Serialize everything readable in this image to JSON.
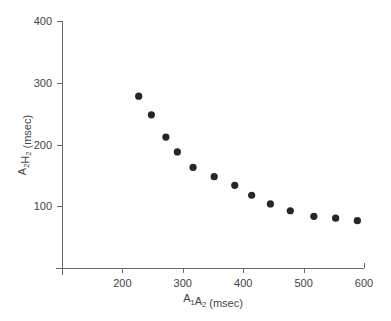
{
  "chart_data": {
    "type": "scatter",
    "title": "",
    "xlabel": "A1A2 (msec)",
    "xlabel_parts": [
      {
        "text": "A",
        "sub": false
      },
      {
        "text": "1",
        "sub": true
      },
      {
        "text": "A",
        "sub": false
      },
      {
        "text": "2",
        "sub": true
      },
      {
        "text": " (msec)",
        "sub": false
      }
    ],
    "ylabel": "A2H2 (msec)",
    "ylabel_parts": [
      {
        "text": "A",
        "sub": false
      },
      {
        "text": "2",
        "sub": true
      },
      {
        "text": "H",
        "sub": false
      },
      {
        "text": "2",
        "sub": true
      },
      {
        "text": " (msec)",
        "sub": false
      }
    ],
    "xlim": [
      100,
      600
    ],
    "ylim": [
      0,
      400
    ],
    "xticks": [
      200,
      300,
      400,
      500,
      600
    ],
    "yticks": [
      100,
      200,
      300,
      400
    ],
    "grid": false,
    "legend": null,
    "marker_color": "#262626",
    "series": [
      {
        "name": "A2H2 vs A1A2",
        "x": [
          227,
          248,
          272,
          291,
          317,
          352,
          386,
          414,
          445,
          478,
          517,
          553,
          589
        ],
        "y": [
          278,
          248,
          212,
          188,
          163,
          148,
          134,
          118,
          104,
          93,
          84,
          81,
          77
        ]
      }
    ]
  }
}
